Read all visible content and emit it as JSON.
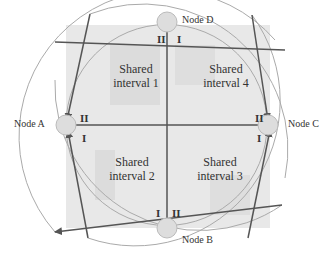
{
  "diagram": {
    "nodes": [
      {
        "id": "A",
        "label": "Node A"
      },
      {
        "id": "B",
        "label": "Node B"
      },
      {
        "id": "C",
        "label": "Node C"
      },
      {
        "id": "D",
        "label": "Node D"
      }
    ],
    "intervals": [
      {
        "line1": "Shared",
        "line2": "interval 1"
      },
      {
        "line1": "Shared",
        "line2": "interval 2"
      },
      {
        "line1": "Shared",
        "line2": "interval 3"
      },
      {
        "line1": "Shared",
        "line2": "interval 4"
      }
    ],
    "markers": {
      "one": "I",
      "two": "II"
    },
    "colors": {
      "square_fill": "#e6e6e6",
      "inner_shade": "#d8d8d8",
      "line": "#555555",
      "arc": "#aaaaaa",
      "node_fill": "#dddddd"
    }
  }
}
